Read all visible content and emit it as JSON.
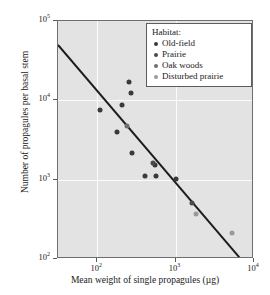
{
  "chart_data": {
    "type": "scatter",
    "title": "",
    "xlabel": "Mean weight of single propagules (µg)",
    "ylabel": "Number of propagules per basal stem",
    "xscale": "log",
    "yscale": "log",
    "xlim": [
      31.6,
      10000
    ],
    "ylim": [
      100,
      100000
    ],
    "grid": true,
    "xticks": [
      {
        "value": 100,
        "label": "10",
        "exp": "2"
      },
      {
        "value": 1000,
        "label": "10",
        "exp": "3"
      },
      {
        "value": 10000,
        "label": "10",
        "exp": "4"
      }
    ],
    "yticks": [
      {
        "value": 100,
        "label": "10",
        "exp": "2"
      },
      {
        "value": 1000,
        "label": "10",
        "exp": "3"
      },
      {
        "value": 10000,
        "label": "10",
        "exp": "4"
      },
      {
        "value": 100000,
        "label": "10",
        "exp": "5"
      }
    ],
    "legend": {
      "title": "Habitat:",
      "position": "top-right",
      "entries": [
        {
          "label": "Old-field",
          "color": "#3a3a3a"
        },
        {
          "label": "Prairie",
          "color": "#4a4a4a"
        },
        {
          "label": "Oak woods",
          "color": "#6f6f6f"
        },
        {
          "label": "Disturbed prairie",
          "color": "#9a9a9a"
        }
      ]
    },
    "trendline": {
      "x": [
        31.6,
        6500
      ],
      "y": [
        50000,
        105
      ],
      "color": "#1c1c1c",
      "width": 2
    },
    "series": [
      {
        "name": "Old-field",
        "color": "#3a3a3a",
        "points": [
          {
            "x": 110,
            "y": 7600
          },
          {
            "x": 180,
            "y": 4000
          },
          {
            "x": 205,
            "y": 8800
          },
          {
            "x": 255,
            "y": 17000
          },
          {
            "x": 270,
            "y": 12300
          },
          {
            "x": 280,
            "y": 2200
          },
          {
            "x": 410,
            "y": 1100
          },
          {
            "x": 540,
            "y": 1550
          },
          {
            "x": 570,
            "y": 1100
          },
          {
            "x": 1000,
            "y": 1030
          }
        ]
      },
      {
        "name": "Prairie",
        "color": "#4a4a4a",
        "points": [
          {
            "x": 520,
            "y": 1620
          },
          {
            "x": 1600,
            "y": 510
          }
        ]
      },
      {
        "name": "Oak woods",
        "color": "#6f6f6f",
        "points": [
          {
            "x": 238,
            "y": 4700
          }
        ]
      },
      {
        "name": "Disturbed prairie",
        "color": "#9a9a9a",
        "points": [
          {
            "x": 1800,
            "y": 370
          },
          {
            "x": 5200,
            "y": 215
          }
        ]
      }
    ]
  },
  "style": {
    "plot_background": "#e3e3e3",
    "grid_color": "#fbfbfb",
    "frame_color": "#6e6e6e",
    "text_color": "#1a1a1a",
    "page_background": "#ffffff"
  }
}
